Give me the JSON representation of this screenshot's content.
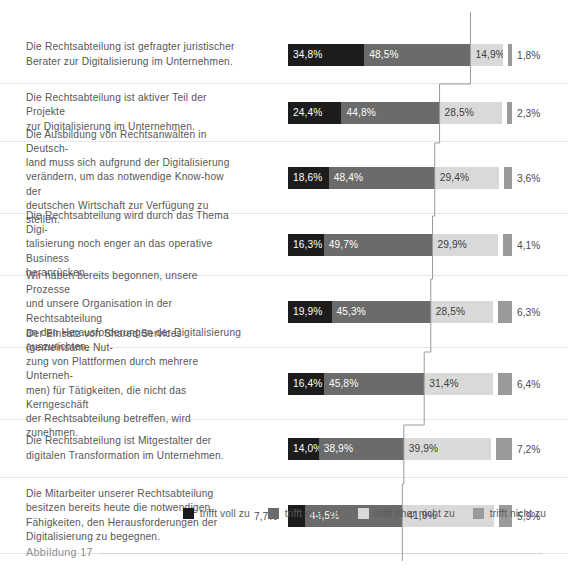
{
  "caption": {
    "label": "Abbildung 17",
    "dots": ""
  },
  "legend": {
    "position": "bottom-right",
    "items": [
      {
        "label": "trifft voll zu",
        "color": "#1c1c1c"
      },
      {
        "label": "trifft eher zu",
        "color": "#6b6b6b"
      },
      {
        "label": "trifft eher nicht zu",
        "color": "#d9d9d9"
      },
      {
        "label": "trifft nicht zu",
        "color": "#9a9a9a"
      }
    ]
  },
  "chart_data": {
    "type": "bar",
    "subtype": "stacked-horizontal-100",
    "title": "",
    "subtitle": "",
    "xlabel": "",
    "ylabel": "",
    "xlim": [
      0,
      100
    ],
    "grid": false,
    "legend_position": "bottom-right",
    "series": [
      {
        "name": "trifft voll zu",
        "color": "#1c1c1c",
        "values": [
          34.8,
          24.4,
          18.6,
          16.3,
          19.9,
          16.4,
          14.0,
          7.7
        ]
      },
      {
        "name": "trifft eher zu",
        "color": "#6b6b6b",
        "values": [
          48.5,
          44.8,
          48.4,
          49.7,
          45.3,
          45.8,
          38.9,
          44.5
        ]
      },
      {
        "name": "trifft eher nicht zu",
        "color": "#d9d9d9",
        "values": [
          14.9,
          28.5,
          29.4,
          29.9,
          28.5,
          31.4,
          39.9,
          41.9
        ]
      },
      {
        "name": "trifft nicht zu",
        "color": "#9a9a9a",
        "values": [
          1.8,
          2.3,
          3.6,
          4.1,
          6.3,
          6.4,
          7.2,
          5.9
        ]
      }
    ],
    "categories": [
      "Die Rechtsabteilung ist gefragter juristischer Berater zur Digitalisierung im Unternehmen.",
      "Die Rechtsabteilung ist aktiver Teil der Projekte zur Digitalisierung im Unternehmen.",
      "Die Ausbildung von Rechtsanwälten in Deutschland muss sich aufgrund der Digitalisierung verändern, um das notwendige Know-how der deutschen Wirtschaft zur Verfügung zu stellen.",
      "Die Rechtsabteilung wird durch das Thema Digitalisierung noch enger an das operative Business heranrücken.",
      "Wir haben bereits begonnen, unsere Prozesse und unsere Organisation in der Rechtsabteilung an den Herausforderungen der Digitalisierung auszurichten.",
      "Der Einsatz von Shared Services (gemeinsame Nutzung von Plattformen durch mehrere Unternehmen) für Tätigkeiten, die nicht das Kerngeschäft der Rechtsabteilung betreffen, wird zunehmen.",
      "Die Rechtsabteilung ist Mitgestalter der digitalen Transformation im Unternehmen.",
      "Die Mitarbeiter unserer Rechtsabteilung besitzen bereits heute die notwendigen Fähigkeiten, den Herausforderungen der Digitalisierung zu begegnen."
    ],
    "annotations": {
      "connector_line": "stepped line linking the cumulative end of the 'trifft eher zu' segment across all rows",
      "connector_color": "#9a9a9a"
    }
  },
  "rows": [
    {
      "label_lines": [
        "Die Rechtsabteilung ist gefragter juristischer",
        "Berater zur Digitalisierung im Unternehmen."
      ],
      "height": 58,
      "segments": [
        {
          "value": 34.8,
          "text": "34,8%",
          "series": "trifft voll zu",
          "inside": true
        },
        {
          "value": 48.5,
          "text": "48,5%",
          "series": "trifft eher zu",
          "inside": true
        },
        {
          "value": 14.9,
          "text": "14,9%",
          "series": "trifft eher nicht zu",
          "inside": true
        },
        {
          "value": 1.8,
          "text": "1,8%",
          "series": "trifft nicht zu",
          "inside": false
        }
      ]
    },
    {
      "label_lines": [
        "Die Rechtsabteilung ist aktiver Teil der Projekte",
        "zur Digitalisierung im Unternehmen."
      ],
      "height": 58,
      "segments": [
        {
          "value": 24.4,
          "text": "24,4%",
          "series": "trifft voll zu",
          "inside": true
        },
        {
          "value": 44.8,
          "text": "44,8%",
          "series": "trifft eher zu",
          "inside": true
        },
        {
          "value": 28.5,
          "text": "28,5%",
          "series": "trifft eher nicht zu",
          "inside": true
        },
        {
          "value": 2.3,
          "text": "2,3%",
          "series": "trifft nicht zu",
          "inside": false
        }
      ]
    },
    {
      "label_lines": [
        "Die Ausbildung von Rechtsanwälten in Deutsch-",
        "land muss sich aufgrund der Digitalisierung",
        "verändern, um das notwendige Know-how der",
        "deutschen Wirtschaft zur Verfügung zu stellen."
      ],
      "height": 72,
      "segments": [
        {
          "value": 18.6,
          "text": "18,6%",
          "series": "trifft voll zu",
          "inside": true
        },
        {
          "value": 48.4,
          "text": "48,4%",
          "series": "trifft eher zu",
          "inside": true
        },
        {
          "value": 29.4,
          "text": "29,4%",
          "series": "trifft eher nicht zu",
          "inside": true
        },
        {
          "value": 3.6,
          "text": "3,6%",
          "series": "trifft nicht zu",
          "inside": false
        }
      ]
    },
    {
      "label_lines": [
        "Die Rechtsabteilung wird durch das Thema Digi-",
        "talisierung noch enger an das operative Business",
        "heranrücken."
      ],
      "height": 62,
      "segments": [
        {
          "value": 16.3,
          "text": "16,3%",
          "series": "trifft voll zu",
          "inside": true
        },
        {
          "value": 49.7,
          "text": "49,7%",
          "series": "trifft eher zu",
          "inside": true
        },
        {
          "value": 29.9,
          "text": "29,9%",
          "series": "trifft eher nicht zu",
          "inside": true
        },
        {
          "value": 4.1,
          "text": "4,1%",
          "series": "trifft nicht zu",
          "inside": false
        }
      ]
    },
    {
      "label_lines": [
        "Wir haben bereits begonnen, unsere Prozesse",
        "und unsere Organisation in der Rechtsabteilung",
        "an den Herausforderungen der Digitalisierung",
        "auszurichten."
      ],
      "height": 72,
      "segments": [
        {
          "value": 19.9,
          "text": "19,9%",
          "series": "trifft voll zu",
          "inside": true
        },
        {
          "value": 45.3,
          "text": "45,3%",
          "series": "trifft eher zu",
          "inside": true
        },
        {
          "value": 28.5,
          "text": "28,5%",
          "series": "trifft eher nicht zu",
          "inside": true
        },
        {
          "value": 6.3,
          "text": "6,3%",
          "series": "trifft nicht zu",
          "inside": false
        }
      ]
    },
    {
      "label_lines": [
        "Der Einsatz von Shared Services (gemeinsame Nut-",
        "zung von Plattformen durch mehrere Unterneh-",
        "men) für Tätigkeiten, die nicht das Kerngeschäft",
        "der Rechtsabteilung betreffen, wird zunehmen."
      ],
      "height": 72,
      "segments": [
        {
          "value": 16.4,
          "text": "16,4%",
          "series": "trifft voll zu",
          "inside": true
        },
        {
          "value": 45.8,
          "text": "45,8%",
          "series": "trifft eher zu",
          "inside": true
        },
        {
          "value": 31.4,
          "text": "31,4%",
          "series": "trifft eher nicht zu",
          "inside": true
        },
        {
          "value": 6.4,
          "text": "6,4%",
          "series": "trifft nicht zu",
          "inside": false
        }
      ]
    },
    {
      "label_lines": [
        "Die Rechtsabteilung ist Mitgestalter der",
        "digitalen Transformation im Unternehmen."
      ],
      "height": 58,
      "segments": [
        {
          "value": 14.0,
          "text": "14,0%",
          "series": "trifft voll zu",
          "inside": true
        },
        {
          "value": 38.9,
          "text": "38,9%",
          "series": "trifft eher zu",
          "inside": true
        },
        {
          "value": 39.9,
          "text": "39,9%",
          "series": "trifft eher nicht zu",
          "inside": true
        },
        {
          "value": 7.2,
          "text": "7,2%",
          "series": "trifft nicht zu",
          "inside": false
        }
      ]
    },
    {
      "label_lines": [
        "Die Mitarbeiter unserer Rechtsabteilung",
        "besitzen bereits heute die notwendigen",
        "Fähigkeiten, den Herausforderungen der",
        "Digitalisierung zu begegnen."
      ],
      "height": 76,
      "segments": [
        {
          "value": 7.7,
          "text": "7,7%",
          "series": "trifft voll zu",
          "inside": false
        },
        {
          "value": 44.5,
          "text": "44,5%",
          "series": "trifft eher zu",
          "inside": true
        },
        {
          "value": 41.9,
          "text": "41,9%",
          "series": "trifft eher nicht zu",
          "inside": true
        },
        {
          "value": 5.9,
          "text": "5,9%",
          "series": "trifft nicht zu",
          "inside": false
        }
      ]
    }
  ]
}
